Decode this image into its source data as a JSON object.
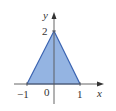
{
  "diagram": {
    "type": "filled-triangle-region",
    "vertices": [
      [
        -1,
        0
      ],
      [
        0,
        2
      ],
      [
        1,
        0
      ]
    ],
    "axes": {
      "x_label": "x",
      "y_label": "y"
    },
    "tick_labels": {
      "x_neg1": "−1",
      "origin": "0",
      "x_pos1": "1",
      "y_2": "2"
    },
    "colors": {
      "fill": "#94b4e2",
      "edge": "#3b64b2",
      "axis": "#555555"
    }
  }
}
